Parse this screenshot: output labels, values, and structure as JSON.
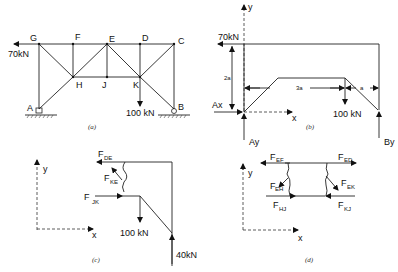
{
  "panels": {
    "a": {
      "caption": "(a)",
      "nodes": [
        "G",
        "F",
        "E",
        "D",
        "C",
        "H",
        "J",
        "K",
        "A",
        "B"
      ],
      "loads": {
        "horizontal": "70kN",
        "vertical": "100 kN"
      }
    },
    "b": {
      "caption": "(b)",
      "axis_y": "y",
      "axis_x": "x",
      "load_top": "70kN",
      "load_bottom": "100 kN",
      "dim_height": "2a",
      "dim_mid": "3a",
      "dim_right": "a",
      "reaction_ax": "Ax",
      "reaction_ay": "Ay",
      "reaction_by": "By"
    },
    "c": {
      "caption": "(c)",
      "axis_y": "y",
      "axis_x": "x",
      "f_de": "F",
      "f_de_sub": "DE",
      "f_ke": "F",
      "f_ke_sub": "KE",
      "f_jk": "F",
      "f_jk_sub": "JK",
      "load": "100 kN",
      "reaction": "40kN"
    },
    "d": {
      "caption": "(d)",
      "axis_y": "y",
      "axis_x": "x",
      "f_ef": "F",
      "f_ef_sub": "EF",
      "f_ed": "F",
      "f_ed_sub": "ED",
      "f_eh": "F",
      "f_eh_sub": "EH",
      "f_ek": "F",
      "f_ek_sub": "EK",
      "f_hj": "F",
      "f_hj_sub": "HJ",
      "f_kj": "F",
      "f_kj_sub": "KJ"
    }
  }
}
